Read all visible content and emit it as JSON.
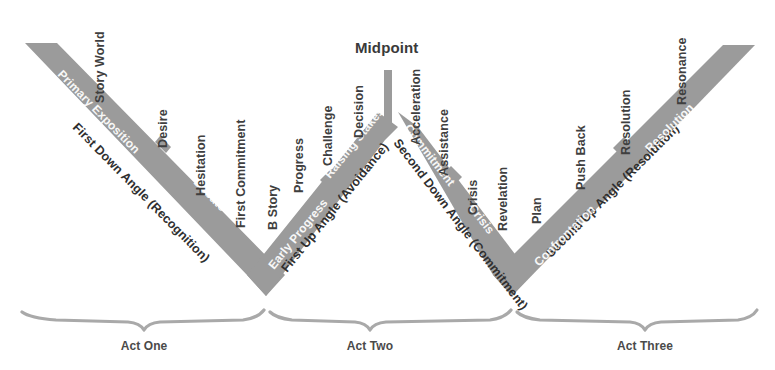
{
  "diagram": {
    "title_label": "Midpoint",
    "colors": {
      "band": "#9b9b9b",
      "brace": "#a9a9a9",
      "label_dark": "#3d3d3d",
      "label_inband": "#ffffff",
      "background": "#ffffff"
    },
    "angle_labels": [
      {
        "id": "first-down-angle",
        "text": "First Down Angle (Recognition)"
      },
      {
        "id": "first-up-angle",
        "text": "First Up Angle (Avoidance)"
      },
      {
        "id": "second-down-angle",
        "text": "Second Down Angle (Commitment)"
      },
      {
        "id": "second-up-angle",
        "text": "Second Up Angle (Resolution)"
      }
    ],
    "inband_labels": [
      {
        "id": "primary-exposition",
        "text": "Primary Exposition"
      },
      {
        "id": "debate",
        "text": "Debate"
      },
      {
        "id": "early-progress",
        "text": "Early Progress"
      },
      {
        "id": "raising-stakes",
        "text": "Raising Stakes"
      },
      {
        "id": "commitment",
        "text": "Commitment"
      },
      {
        "id": "crisis-band",
        "text": "Crisis"
      },
      {
        "id": "confrontation",
        "text": "Confrontation"
      },
      {
        "id": "resolution-band",
        "text": "Resolution"
      }
    ],
    "beat_labels": [
      {
        "id": "story-world",
        "text": "Story World"
      },
      {
        "id": "desire",
        "text": "Desire"
      },
      {
        "id": "hesitation",
        "text": "Hesitation"
      },
      {
        "id": "first-commitment",
        "text": "First Commitment"
      },
      {
        "id": "b-story",
        "text": "B Story"
      },
      {
        "id": "progress",
        "text": "Progress"
      },
      {
        "id": "challenge",
        "text": "Challenge"
      },
      {
        "id": "decision",
        "text": "Decision"
      },
      {
        "id": "acceleration",
        "text": "Acceleration"
      },
      {
        "id": "assistance",
        "text": "Assistance"
      },
      {
        "id": "crisis",
        "text": "Crisis"
      },
      {
        "id": "revelation",
        "text": "Revelation"
      },
      {
        "id": "plan",
        "text": "Plan"
      },
      {
        "id": "push-back",
        "text": "Push Back"
      },
      {
        "id": "resolution",
        "text": "Resolution"
      },
      {
        "id": "resonance",
        "text": "Resonance"
      }
    ],
    "acts": [
      {
        "id": "act-one",
        "label": "Act One"
      },
      {
        "id": "act-two",
        "label": "Act Two"
      },
      {
        "id": "act-three",
        "label": "Act Three"
      }
    ]
  }
}
